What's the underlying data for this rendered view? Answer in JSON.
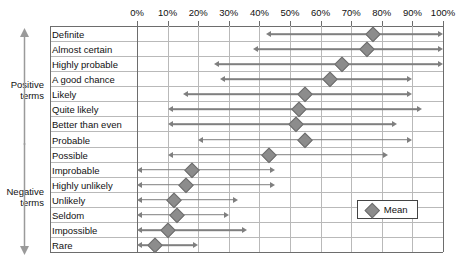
{
  "axis": {
    "tick_labels": [
      "0%",
      "10%",
      "20%",
      "30%",
      "40%",
      "50%",
      "60%",
      "70%",
      "80%",
      "90%",
      "100%"
    ],
    "min": 0,
    "max": 100
  },
  "groups": {
    "positive": {
      "label": "Positive\nterms",
      "icon": "up-arrow-icon"
    },
    "negative": {
      "label": "Negative\nterms",
      "icon": "down-arrow-icon"
    }
  },
  "legend": {
    "marker_label": "Mean",
    "marker_icon": "diamond-icon"
  },
  "colors": {
    "marker": "#8c8c8c",
    "arrow": "#7f7f7f",
    "gridline": "#b9b9b9",
    "frame": "#6d6d6d",
    "text": "#111111"
  },
  "chart_data": {
    "type": "scatter",
    "title": "",
    "xlabel": "",
    "ylabel": "",
    "xlim": [
      0,
      100
    ],
    "grid": true,
    "legend_position": "bottom-right",
    "categories": [
      "Definite",
      "Almost certain",
      "Highly probable",
      "A good chance",
      "Likely",
      "Quite likely",
      "Better than even",
      "Probable",
      "Possible",
      "Improbable",
      "Highly unlikely",
      "Unlikely",
      "Seldom",
      "Impossible",
      "Rare"
    ],
    "series": [
      {
        "name": "Mean",
        "values": [
          77,
          75,
          67,
          63,
          55,
          53,
          52,
          55,
          43,
          18,
          16,
          12,
          13,
          10,
          6
        ]
      },
      {
        "name": "Range low",
        "values": [
          42,
          38,
          25,
          27,
          15,
          10,
          10,
          20,
          10,
          0,
          0,
          0,
          0,
          0,
          0
        ]
      },
      {
        "name": "Range high",
        "values": [
          100,
          100,
          100,
          90,
          90,
          93,
          85,
          90,
          82,
          45,
          45,
          33,
          30,
          36,
          20
        ]
      }
    ],
    "rows": [
      {
        "label": "Definite",
        "group": "positive",
        "low": 42,
        "high": 100,
        "mean": 77
      },
      {
        "label": "Almost certain",
        "group": "positive",
        "low": 38,
        "high": 100,
        "mean": 75
      },
      {
        "label": "Highly probable",
        "group": "positive",
        "low": 25,
        "high": 100,
        "mean": 67
      },
      {
        "label": "A good chance",
        "group": "positive",
        "low": 27,
        "high": 90,
        "mean": 63
      },
      {
        "label": "Likely",
        "group": "positive",
        "low": 15,
        "high": 90,
        "mean": 55
      },
      {
        "label": "Quite likely",
        "group": "positive",
        "low": 10,
        "high": 93,
        "mean": 53
      },
      {
        "label": "Better than even",
        "group": "positive",
        "low": 10,
        "high": 85,
        "mean": 52
      },
      {
        "label": "Probable",
        "group": "positive",
        "low": 20,
        "high": 90,
        "mean": 55
      },
      {
        "label": "Possible",
        "group": "positive",
        "low": 10,
        "high": 82,
        "mean": 43
      },
      {
        "label": "Improbable",
        "group": "negative",
        "low": 0,
        "high": 45,
        "mean": 18
      },
      {
        "label": "Highly unlikely",
        "group": "negative",
        "low": 0,
        "high": 45,
        "mean": 16
      },
      {
        "label": "Unlikely",
        "group": "negative",
        "low": 0,
        "high": 33,
        "mean": 12
      },
      {
        "label": "Seldom",
        "group": "negative",
        "low": 0,
        "high": 30,
        "mean": 13
      },
      {
        "label": "Impossible",
        "group": "negative",
        "low": 0,
        "high": 36,
        "mean": 10
      },
      {
        "label": "Rare",
        "group": "negative",
        "low": 0,
        "high": 20,
        "mean": 6
      }
    ]
  }
}
